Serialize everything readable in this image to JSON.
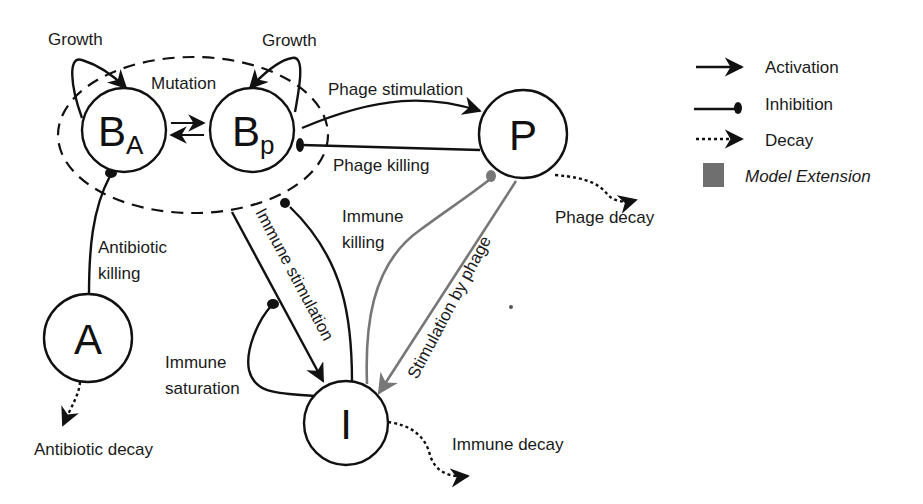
{
  "nodes": {
    "ba": {
      "label": "B",
      "sub": "A"
    },
    "bp": {
      "label": "B",
      "sub": "p"
    },
    "p": {
      "label": "P"
    },
    "a": {
      "label": "A"
    },
    "i": {
      "label": "I"
    }
  },
  "edges": {
    "growth_ba": "Growth",
    "growth_bp": "Growth",
    "mutation": "Mutation",
    "phage_stimulation": "Phage stimulation",
    "phage_killing": "Phage killing",
    "phage_decay": "Phage decay",
    "antibiotic_killing_1": "Antibiotic",
    "antibiotic_killing_2": "killing",
    "antibiotic_decay": "Antibiotic decay",
    "immune_stimulation": "Immune stimulation",
    "immune_killing_1": "Immune",
    "immune_killing_2": "killing",
    "immune_saturation_1": "Immune",
    "immune_saturation_2": "saturation",
    "stimulation_by_phage": "Stimulation by phage",
    "immune_decay": "Immune decay"
  },
  "legend": {
    "activation": "Activation",
    "inhibition": "Inhibition",
    "decay": "Decay",
    "model_extension": "Model Extension"
  },
  "colors": {
    "line": "#111111",
    "extension": "#777777",
    "legend_swatch": "#6f6f6f"
  }
}
